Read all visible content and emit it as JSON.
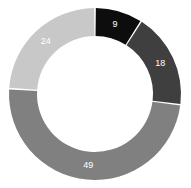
{
  "chart_data": {
    "type": "pie",
    "variant": "donut",
    "title": "",
    "subtitle": "",
    "xlabel": "",
    "ylabel": "",
    "grid": false,
    "legend": "none",
    "total": 100,
    "units": "percent",
    "start_angle_deg": 0,
    "direction": "clockwise",
    "categories": [
      "9",
      "18",
      "49",
      "24"
    ],
    "values": [
      9,
      18,
      49,
      24
    ],
    "labels": [
      "9",
      "18",
      "49",
      "24"
    ],
    "slices": [
      {
        "label": "9",
        "value": 9,
        "color": "#0d0d0d",
        "label_color": "#ffffff",
        "start_deg": 0.0,
        "end_deg": 32.4
      },
      {
        "label": "18",
        "value": 18,
        "color": "#3f3f3f",
        "label_color": "#ffffff",
        "start_deg": 32.4,
        "end_deg": 97.2
      },
      {
        "label": "49",
        "value": 49,
        "color": "#808080",
        "label_color": "#ffffff",
        "start_deg": 97.2,
        "end_deg": 273.6
      },
      {
        "label": "24",
        "value": 24,
        "color": "#c8c8c8",
        "label_color": "#ffffff",
        "start_deg": 273.6,
        "end_deg": 360.0
      }
    ],
    "geometry": {
      "center_x": 95,
      "center_y": 94,
      "outer_radius": 86,
      "inner_radius": 58,
      "gap_deg": 1.1,
      "label_radius": 72
    },
    "background_color": "#ffffff"
  }
}
